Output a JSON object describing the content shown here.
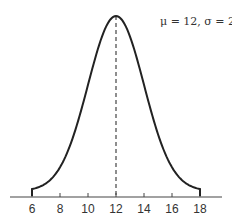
{
  "chart_data": {
    "type": "line",
    "title": "",
    "xlabel": "",
    "ylabel": "",
    "annotation": "μ = 12,  σ = 2",
    "distribution": "normal",
    "mean": 12,
    "std_dev": 2,
    "x_ticks": [
      6,
      8,
      10,
      12,
      14,
      16,
      18
    ],
    "xlim": [
      5.5,
      19.5
    ],
    "curve_range": [
      6,
      18
    ],
    "mean_line": {
      "x": 12,
      "style": "dashed"
    },
    "grid": false,
    "y_axis_shown": false,
    "series": [
      {
        "name": "N(12, 2)",
        "x": [
          6,
          7,
          8,
          9,
          10,
          11,
          12,
          13,
          14,
          15,
          16,
          17,
          18
        ],
        "values": [
          0.0022,
          0.0088,
          0.027,
          0.0648,
          0.121,
          0.176,
          0.1995,
          0.176,
          0.121,
          0.0648,
          0.027,
          0.0088,
          0.0022
        ]
      }
    ]
  },
  "colors": {
    "curve": "#222222",
    "axis": "#444444",
    "text": "#333333"
  }
}
